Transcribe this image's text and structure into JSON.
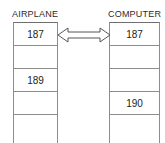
{
  "diagram": {
    "title_left": "AIRPLANE",
    "title_right": "COMPUTER",
    "connector": {
      "icon": "double-headed-arrow-icon",
      "direction": "bidirectional",
      "stroke_color": "#555555",
      "fill_color": "#ffffff"
    },
    "style": {
      "background": "#ffffff",
      "border_color": "#8d8d8d",
      "text_color": "#1c1c1c"
    },
    "columns": [
      {
        "name": "airplane",
        "header": "AIRPLANE",
        "cells": [
          {
            "value": "187",
            "empty": false
          },
          {
            "value": "",
            "empty": true
          },
          {
            "value": "189",
            "empty": false
          },
          {
            "value": "",
            "empty": true
          },
          {
            "value": "",
            "empty": true
          }
        ]
      },
      {
        "name": "computer",
        "header": "COMPUTER",
        "cells": [
          {
            "value": "187",
            "empty": false
          },
          {
            "value": "",
            "empty": true
          },
          {
            "value": "",
            "empty": true
          },
          {
            "value": "190",
            "empty": false
          },
          {
            "value": "",
            "empty": true
          }
        ]
      }
    ]
  }
}
